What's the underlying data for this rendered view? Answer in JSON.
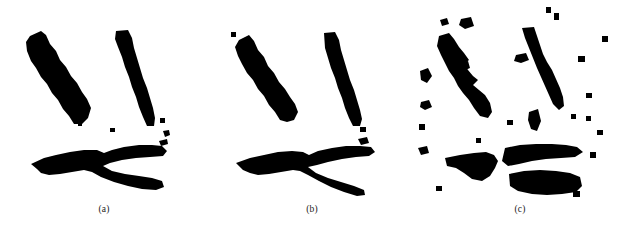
{
  "figure": {
    "background_color": "#ffffff",
    "ink_color": "#000000",
    "caption_color": "#1a1a1a",
    "width": 625,
    "height": 237,
    "panel_count": 3
  },
  "panels": [
    {
      "id": "panel-a",
      "caption": "(a)",
      "condition": "original binary silhouette, clean",
      "noise_speck_count": 5,
      "components": [
        "left-handle",
        "right-handle",
        "jaw-fork"
      ]
    },
    {
      "id": "panel-b",
      "caption": "(b)",
      "condition": "lightly eroded silhouette, thinned jaw",
      "noise_speck_count": 3,
      "components": [
        "left-handle",
        "right-handle",
        "jaw-fork"
      ]
    },
    {
      "id": "panel-c",
      "caption": "(c)",
      "condition": "heavily degraded, fragmented with salt-and-pepper noise",
      "noise_speck_count": 19,
      "components": [
        "left-handle-broken",
        "right-handle-broken",
        "jaw-blob-left",
        "jaw-blob-upper-right",
        "jaw-blob-lower-right"
      ]
    }
  ]
}
